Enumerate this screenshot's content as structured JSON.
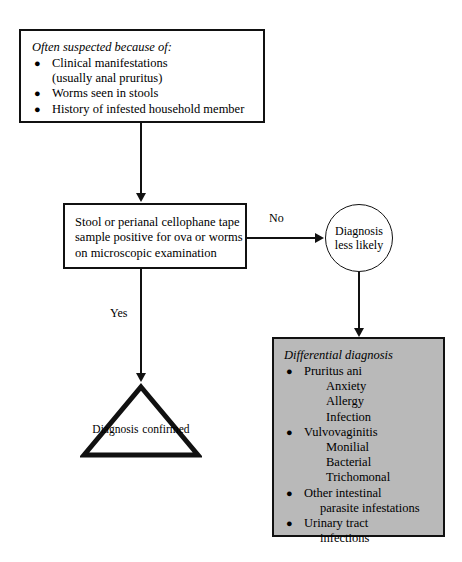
{
  "diagram": {
    "colors": {
      "line": "#111111",
      "box_background": "#ffffff",
      "differential_background": "#b9b9b9",
      "text": "#000000"
    }
  },
  "suspect_box": {
    "heading": "Often suspected because of:",
    "bullet_glyph": "●",
    "items": [
      {
        "text": "Clinical manifestations",
        "continuation": "(usually anal pruritus)"
      },
      {
        "text": "Worms seen in stools",
        "continuation": ""
      },
      {
        "text": "History of infested household member",
        "continuation": ""
      }
    ]
  },
  "test_box": {
    "lines": [
      "Stool or perianal cellophane tape",
      "sample positive for ova or worms",
      "on microscopic examination"
    ]
  },
  "edges": {
    "no_label": "No",
    "yes_label": "Yes"
  },
  "circle_node": {
    "lines": [
      "Diagnosis",
      "less likely"
    ]
  },
  "triangle_node": {
    "lines": [
      "Diagnosis",
      "confirmed"
    ]
  },
  "differential_box": {
    "heading": "Differential diagnosis",
    "bullet_glyph": "●",
    "items": [
      {
        "text": "Pruritus ani",
        "continuation": "",
        "subitems": [
          "Anxiety",
          "Allergy",
          "Infection"
        ]
      },
      {
        "text": "Vulvovaginitis",
        "continuation": "",
        "subitems": [
          "Monilial",
          "Bacterial",
          "Trichomonal"
        ]
      },
      {
        "text": "Other intestinal",
        "continuation": "parasite infestations",
        "subitems": []
      },
      {
        "text": "Urinary tract",
        "continuation": "infections",
        "subitems": []
      }
    ]
  }
}
